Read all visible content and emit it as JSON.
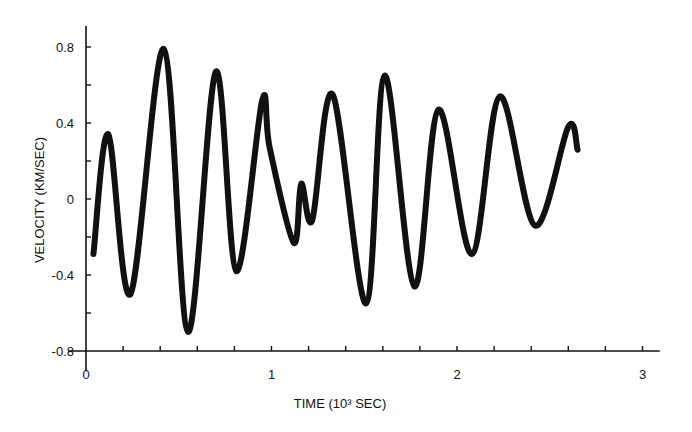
{
  "chart_data": {
    "type": "line",
    "title": "",
    "xlabel": "TIME (10³ SEC)",
    "ylabel": "VELOCITY (KM/SEC)",
    "xlim": [
      0,
      3.05
    ],
    "ylim": [
      -0.8,
      0.85
    ],
    "x_ticks": [
      {
        "value": 0,
        "label": "0"
      },
      {
        "value": 1,
        "label": "1"
      },
      {
        "value": 2,
        "label": "2"
      },
      {
        "value": 3,
        "label": "3"
      }
    ],
    "x_minor_step": 0.2,
    "y_ticks": [
      {
        "value": 0.8,
        "label": "0.8"
      },
      {
        "value": 0.4,
        "label": "0.4"
      },
      {
        "value": 0,
        "label": "0"
      },
      {
        "value": -0.4,
        "label": "-0.4"
      },
      {
        "value": -0.8,
        "label": "-0.8"
      }
    ],
    "y_minor_step": 0.2,
    "grid": false,
    "legend": null,
    "series": [
      {
        "name": "velocity",
        "color": "#111111",
        "x": [
          0.04,
          0.12,
          0.24,
          0.42,
          0.55,
          0.7,
          0.81,
          0.95,
          0.99,
          1.12,
          1.16,
          1.22,
          1.33,
          1.51,
          1.61,
          1.77,
          1.9,
          2.08,
          2.23,
          2.42,
          2.6,
          2.65
        ],
        "values": [
          -0.29,
          0.34,
          -0.5,
          0.79,
          -0.7,
          0.67,
          -0.38,
          0.52,
          0.27,
          -0.23,
          0.08,
          -0.11,
          0.55,
          -0.55,
          0.65,
          -0.46,
          0.47,
          -0.29,
          0.54,
          -0.14,
          0.38,
          0.26
        ]
      }
    ]
  },
  "layout": {
    "plot": {
      "x0_px": 86,
      "x_px_per_unit": 185.5,
      "y0_px": 199,
      "y_px_per_unit": 190
    },
    "axis_color": "#111111",
    "line_width": 6
  }
}
